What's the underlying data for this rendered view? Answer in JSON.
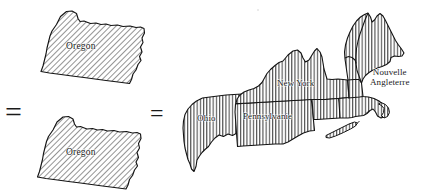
{
  "figure": {
    "kind": "comparative-area-map-diagram",
    "background_color": "#ffffff",
    "ink_color": "#1a1a1a",
    "hatch_color": "#555555",
    "relations": [
      {
        "name": "equals-left",
        "symbol": "="
      },
      {
        "name": "equals-middle",
        "symbol": "="
      }
    ],
    "left_panel": {
      "name": "oregon-stack",
      "hatch_style": "diagonal-45",
      "shapes": [
        {
          "id": "oregon-top",
          "label": "Oregon"
        },
        {
          "id": "oregon-bottom",
          "label": "Oregon"
        }
      ]
    },
    "right_panel": {
      "name": "northeast-states-map",
      "hatch_style": "vertical",
      "regions": [
        {
          "id": "ohio",
          "label": "Ohio"
        },
        {
          "id": "pennsylvania",
          "label": "Pennsylvanie"
        },
        {
          "id": "new-york",
          "label": "New York"
        },
        {
          "id": "new-england",
          "label": "Nouvelle\nAngleterre"
        },
        {
          "id": "long-island",
          "label": ""
        },
        {
          "id": "cape-cod",
          "label": ""
        }
      ]
    }
  }
}
